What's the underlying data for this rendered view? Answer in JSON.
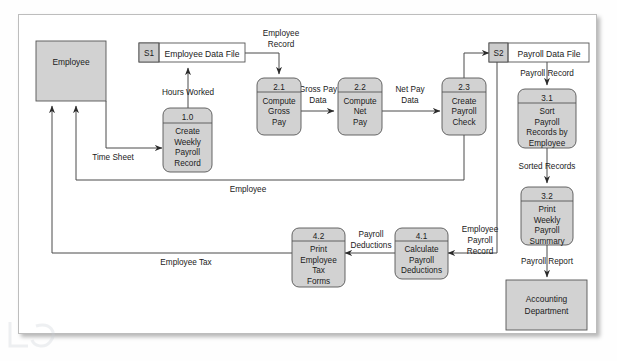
{
  "diagram": {
    "colors": {
      "process_fill": "#d2d2d2",
      "entity_fill": "#d2d2d2",
      "store_fill": "#ffffff",
      "store_tab_fill": "#cccccc",
      "line": "#4a4a4a",
      "text": "#1a1a1a",
      "frame_border": "#bdbdbd"
    },
    "external_entities": [
      {
        "id": "employee",
        "label": "Employee"
      },
      {
        "id": "accounting",
        "label_line1": "Accounting",
        "label_line2": "Department"
      }
    ],
    "data_stores": [
      {
        "id": "S1",
        "number": "S1",
        "name": "Employee Data File"
      },
      {
        "id": "S2",
        "number": "S2",
        "name": "Payroll Data File"
      }
    ],
    "processes": [
      {
        "id": "p1_0",
        "number": "1.0",
        "lines": [
          "Create",
          "Weekly",
          "Payroll",
          "Record"
        ]
      },
      {
        "id": "p2_1",
        "number": "2.1",
        "lines": [
          "Compute",
          "Gross",
          "Pay"
        ]
      },
      {
        "id": "p2_2",
        "number": "2.2",
        "lines": [
          "Compute",
          "Net",
          "Pay"
        ]
      },
      {
        "id": "p2_3",
        "number": "2.3",
        "lines": [
          "Create",
          "Payroll",
          "Check"
        ]
      },
      {
        "id": "p3_1",
        "number": "3.1",
        "lines": [
          "Sort",
          "Payroll",
          "Records by",
          "Employee"
        ]
      },
      {
        "id": "p3_2",
        "number": "3.2",
        "lines": [
          "Print",
          "Weekly",
          "Payroll",
          "Summary"
        ]
      },
      {
        "id": "p4_1",
        "number": "4.1",
        "lines": [
          "Calculate",
          "Payroll",
          "Deductions"
        ]
      },
      {
        "id": "p4_2",
        "number": "4.2",
        "lines": [
          "Print",
          "Employee",
          "Tax",
          "Forms"
        ]
      }
    ],
    "data_flows": [
      {
        "id": "time_sheet",
        "label": "Time Sheet",
        "from": "employee",
        "to": "p1_0"
      },
      {
        "id": "hours_worked",
        "label": "Hours Worked",
        "from": "p1_0",
        "to": "S1"
      },
      {
        "id": "employee_record_top",
        "line1": "Employee",
        "line2": "Record",
        "from": "S1",
        "to": "p2_1"
      },
      {
        "id": "gross_pay_data",
        "line1": "Gross Pay",
        "line2": "Data",
        "from": "p2_1",
        "to": "p2_2"
      },
      {
        "id": "net_pay_data",
        "line1": "Net Pay",
        "line2": "Data",
        "from": "p2_2",
        "to": "p2_3"
      },
      {
        "id": "to_payroll_store",
        "label": "",
        "from": "p2_3",
        "to": "S2"
      },
      {
        "id": "payroll_record",
        "label": "Payroll Record",
        "from": "S2",
        "to": "p3_1"
      },
      {
        "id": "sorted_records",
        "label": "Sorted Records",
        "from": "p3_1",
        "to": "p3_2"
      },
      {
        "id": "payroll_report",
        "label": "Payroll Report",
        "from": "p3_2",
        "to": "accounting"
      },
      {
        "id": "employee_flow",
        "label": "Employee",
        "from": "p2_3",
        "to": "employee"
      },
      {
        "id": "employee_payroll_record",
        "line1": "Employee",
        "line2": "Payroll",
        "line3": "Record",
        "from": "S2",
        "to": "p4_1"
      },
      {
        "id": "payroll_deductions",
        "line1": "Payroll",
        "line2": "Deductions",
        "from": "p4_1",
        "to": "p4_2"
      },
      {
        "id": "employee_tax",
        "label": "Employee Tax",
        "from": "p4_2",
        "to": "employee"
      }
    ]
  }
}
